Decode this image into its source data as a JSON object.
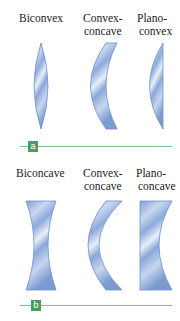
{
  "panel_a": {
    "label": "a",
    "lenses": [
      {
        "name": "Biconvex",
        "line1": "Biconvex",
        "line2": ""
      },
      {
        "name": "Convex-concave",
        "line1": "Convex-",
        "line2": "concave"
      },
      {
        "name": "Plano-convex",
        "line1": "Plano-",
        "line2": "convex"
      }
    ]
  },
  "panel_b": {
    "label": "b",
    "lenses": [
      {
        "name": "Biconcave",
        "line1": "Biconcave",
        "line2": ""
      },
      {
        "name": "Convex-concave",
        "line1": "Convex-",
        "line2": "concave"
      },
      {
        "name": "Plano-concave",
        "line1": "Plano-",
        "line2": "concave"
      }
    ]
  },
  "colors": {
    "lens_light": "#e6eef9",
    "lens_mid": "#a9c1e6",
    "lens_dark": "#6f8fc8",
    "rule": "#7fbf8f",
    "badge": "#4f9a5f"
  }
}
